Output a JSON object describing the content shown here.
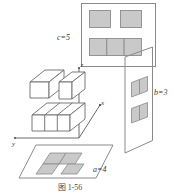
{
  "figure": {
    "caption": "图  1-56",
    "caption_label": "图",
    "caption_number": "1-56",
    "axes": {
      "x_label": "x",
      "y_label": "y",
      "z_label": "z"
    },
    "dimension_labels": {
      "front_view": "c=5",
      "side_view": "b=3",
      "top_view": "a=4"
    },
    "colors": {
      "stroke": "#6b6b6b",
      "shade_fill": "#c9c9c9",
      "panel_stroke": "#8a8a8a",
      "background": "#ffffff",
      "text": "#3a3a3a"
    },
    "views": {
      "front_view_panel": {
        "name": "front-view",
        "label": "c=5",
        "top_row_cells": 2,
        "bottom_row_cells": 3
      },
      "side_view_panel": {
        "name": "side-view",
        "label": "b=3",
        "upper_cells": 2,
        "lower_cells": 1
      },
      "top_view_panel": {
        "name": "top-view",
        "label": "a=4",
        "shaded_cells": 4
      }
    },
    "solid": {
      "name": "unit-cube-assembly",
      "bottom_row_cubes": 3,
      "top_cubes": 2
    }
  }
}
